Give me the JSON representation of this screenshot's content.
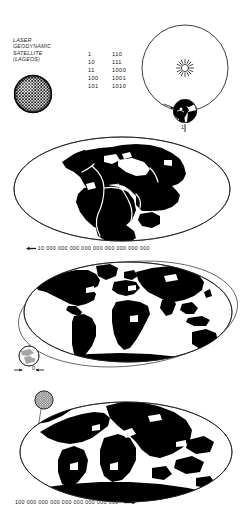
{
  "figure": {
    "type": "diagram"
  },
  "header": {
    "satellite_label": {
      "line1": "LASER",
      "line2": "GEODYNAMIC",
      "line3": "SATELLITE",
      "line4": "(LAGEOS)"
    },
    "satellite_icon": "lageos-sphere-icon",
    "binary_table": {
      "rows": [
        {
          "left": "1",
          "right": "110"
        },
        {
          "left": "10",
          "right": "111"
        },
        {
          "left": "11",
          "right": "1000"
        },
        {
          "left": "100",
          "right": "1001"
        },
        {
          "left": "101",
          "right": "1010"
        }
      ]
    },
    "orbit": {
      "sun_icon": "sun-icon",
      "earth_icon": "earth-globe-icon",
      "tick_label": "1"
    }
  },
  "maps": [
    {
      "id": "map-past",
      "name": "pangaea-supercontinent-map",
      "projection": "mollweide",
      "caption": "10 000 000 000 000 000 000 000 000 000",
      "caption_marker": "left-arrow",
      "marker_position": "left"
    },
    {
      "id": "map-present",
      "name": "present-day-world-map",
      "projection": "mollweide",
      "caption": "",
      "earth_marker_label": "0",
      "earth_icon": "earth-globe-icon",
      "orbit_path": "elliptical-orbit-path"
    },
    {
      "id": "map-future",
      "name": "future-continents-map",
      "projection": "mollweide",
      "caption": "100 000 000 000 000 000 000 000 000",
      "caption_marker": "right-arrow",
      "marker_position": "right",
      "satellite_icon": "lageos-sphere-icon"
    }
  ],
  "colors": {
    "land": "#000000",
    "ocean": "#ffffff",
    "outline": "#1a1a1a",
    "text": "#161616"
  }
}
